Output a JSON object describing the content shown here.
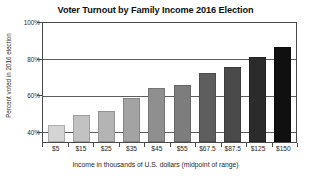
{
  "chart_data": {
    "type": "bar",
    "title": "Voter Turnout by Family Income 2016 Election",
    "xlabel": "Income in thousands of U.S. dollars (midpoint of range)",
    "ylabel": "Percent voted in 2016 election",
    "categories": [
      "$5",
      "$15",
      "$25",
      "$35",
      "$45",
      "$55",
      "$67.5",
      "$87.5",
      "$125",
      "$150"
    ],
    "values": [
      48.5,
      53.5,
      55.5,
      62,
      67,
      68.5,
      74,
      77,
      82,
      87
    ],
    "ylim": [
      40,
      100
    ],
    "yticks": [
      "40%",
      "60%",
      "80%",
      "100%"
    ],
    "ytick_values": [
      40,
      60,
      80,
      100
    ],
    "grid": true,
    "legend": "none",
    "bar_colors": [
      "#d4d4d4",
      "#c2c2c2",
      "#b4b4b4",
      "#a3a3a3",
      "#8f8f8f",
      "#7d7d7d",
      "#5e5e5e",
      "#4a4a4a",
      "#2b2b2b",
      "#101010"
    ],
    "axis_color": "#4a4a4a",
    "gridline_color": "#5d5d5d",
    "background": "#ffffff"
  }
}
